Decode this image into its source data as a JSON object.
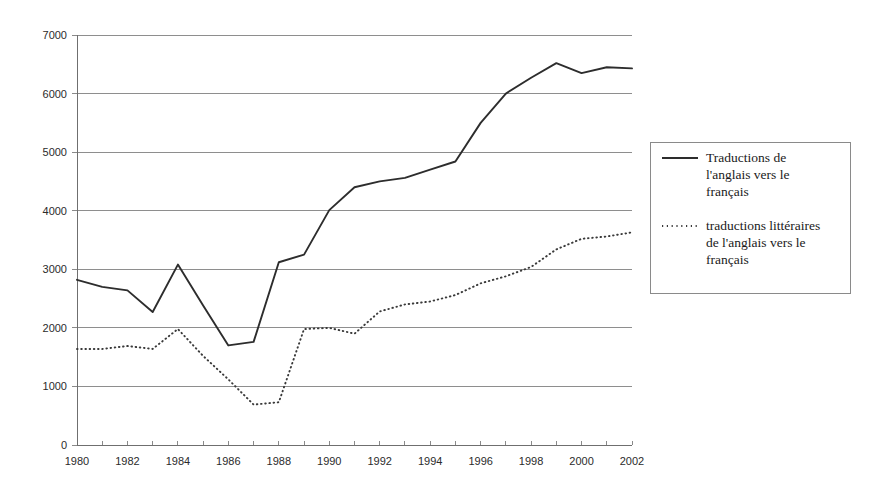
{
  "chart_data": {
    "type": "line",
    "title": "",
    "subtitle": "",
    "xlabel": "",
    "ylabel": "",
    "xlim": [
      1980,
      2002
    ],
    "ylim": [
      0,
      7000
    ],
    "grid": true,
    "legend_position": "right",
    "x": [
      1980,
      1981,
      1982,
      1983,
      1984,
      1985,
      1986,
      1987,
      1988,
      1989,
      1990,
      1991,
      1992,
      1993,
      1994,
      1995,
      1996,
      1997,
      1998,
      1999,
      2000,
      2001,
      2002
    ],
    "xticklabels": [
      "1980",
      "1982",
      "1984",
      "1986",
      "1988",
      "1990",
      "1992",
      "1994",
      "1996",
      "1998",
      "2000",
      "2002"
    ],
    "xtickvalues": [
      1980,
      1982,
      1984,
      1986,
      1988,
      1990,
      1992,
      1994,
      1996,
      1998,
      2000,
      2002
    ],
    "yticklabels": [
      "0",
      "1000",
      "2000",
      "3000",
      "4000",
      "5000",
      "6000",
      "7000"
    ],
    "ytickvalues": [
      0,
      1000,
      2000,
      3000,
      4000,
      5000,
      6000,
      7000
    ],
    "series": [
      {
        "name": "Traductions de l'anglais vers le français",
        "style": "solid",
        "color": "#2d2d2d",
        "values": [
          2820,
          2700,
          2640,
          2270,
          3080,
          2380,
          1700,
          1760,
          3120,
          3250,
          4010,
          4400,
          4500,
          4560,
          4700,
          4840,
          5500,
          6000,
          6270,
          6520,
          6350,
          6450,
          6430
        ]
      },
      {
        "name": "traductions littéraires de l'anglais vers le français",
        "style": "dotted",
        "color": "#3a3a3a",
        "values": [
          1640,
          1640,
          1690,
          1640,
          1980,
          1520,
          1120,
          690,
          730,
          1980,
          2000,
          1900,
          2280,
          2400,
          2450,
          2560,
          2760,
          2880,
          3040,
          3340,
          3520,
          3560,
          3630
        ]
      }
    ]
  },
  "legend": {
    "entries": [
      {
        "sample": "solid-line-sample",
        "lines": [
          "Traductions de",
          "l'anglais vers le",
          "français"
        ]
      },
      {
        "sample": "dotted-line-sample",
        "lines": [
          "traductions littéraires",
          "de l'anglais vers le",
          "français"
        ]
      }
    ]
  }
}
